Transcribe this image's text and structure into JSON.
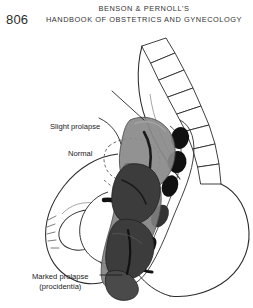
{
  "page": {
    "number": "806",
    "header_line1": "BENSON & PERNOLL'S",
    "header_line2": "HANDBOOK OF OBSTETRICS AND GYNECOLOGY"
  },
  "figure": {
    "name": "uterine-prolapse-sagittal-pelvis",
    "labels": {
      "slight_prolapse": "Slight prolapse",
      "normal": "Normal",
      "marked_prolapse_line1": "Marked prolapse",
      "marked_prolapse_line2": "(procidentia)"
    },
    "colors": {
      "ink": "#1a1a1a",
      "outline": "#2b2b2b",
      "slight_prolapse_fill": "#8a8a8a",
      "marked_prolapse_fill": "#3c3c3c",
      "normal_outline": "#555555",
      "paper": "#ffffff",
      "organ_dark": "#111111"
    }
  }
}
